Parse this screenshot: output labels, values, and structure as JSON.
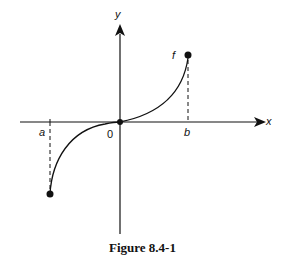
{
  "figure": {
    "caption": "Figure 8.4-1",
    "labels": {
      "y_axis": "y",
      "x_axis": "x",
      "function": "f",
      "a": "a",
      "b": "b",
      "origin": "0"
    }
  }
}
